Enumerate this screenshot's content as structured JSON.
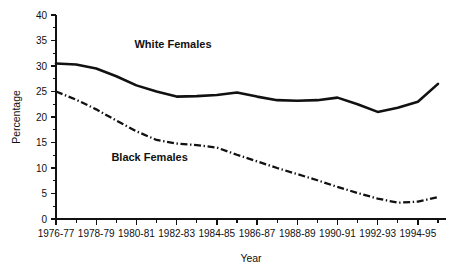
{
  "chart_data": {
    "type": "line",
    "title": "",
    "xlabel": "Year",
    "ylabel": "Percentage",
    "ylim": [
      0,
      40
    ],
    "yticks": [
      0,
      5,
      10,
      15,
      20,
      25,
      30,
      35,
      40
    ],
    "ytick_labels": [
      "0",
      "5",
      "10",
      "15",
      "20",
      "25",
      "30",
      "35",
      "40"
    ],
    "grid": false,
    "legend_position": "inline-annotations",
    "categories": [
      "1976-77",
      "1977-78",
      "1978-79",
      "1979-80",
      "1980-81",
      "1981-82",
      "1982-83",
      "1983-84",
      "1984-85",
      "1985-86",
      "1986-87",
      "1987-88",
      "1988-89",
      "1989-90",
      "1990-91",
      "1991-92",
      "1992-93",
      "1993-94",
      "1994-95",
      "1995-96"
    ],
    "xtick_labels": [
      "1976-77",
      "1978-79",
      "1980-81",
      "1982-83",
      "1984-85",
      "1986-87",
      "1988-89",
      "1990-91",
      "1992-93",
      "1994-95"
    ],
    "series": [
      {
        "name": "White Females",
        "style": "solid",
        "color": "#111111",
        "values": [
          30.5,
          30.3,
          29.5,
          28.0,
          26.2,
          25.0,
          24.0,
          24.1,
          24.3,
          24.8,
          24.0,
          23.3,
          23.2,
          23.3,
          23.8,
          22.5,
          21.0,
          21.8,
          23.0,
          26.5
        ]
      },
      {
        "name": "Black Females",
        "style": "dash-dot",
        "color": "#111111",
        "values": [
          25.0,
          23.4,
          21.5,
          19.3,
          17.2,
          15.5,
          14.8,
          14.5,
          14.0,
          12.6,
          11.3,
          10.0,
          8.8,
          7.6,
          6.3,
          5.1,
          4.0,
          3.2,
          3.4,
          4.3
        ]
      }
    ],
    "annotations": [
      {
        "text": "White Females",
        "x_fraction": 0.3,
        "y_value": 33.6
      },
      {
        "text": "Black Females",
        "x_fraction": 0.24,
        "y_value": 11.4
      }
    ]
  }
}
